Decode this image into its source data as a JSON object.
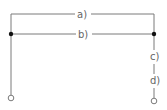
{
  "diagram": {
    "type": "circuit-wiring",
    "line_color": "#7a7a7a",
    "node_color": "#111111",
    "labels": {
      "a": "a)",
      "b": "b)",
      "c": "c)",
      "d": "d)"
    },
    "terminals": [
      "left-terminal",
      "right-terminal"
    ]
  }
}
